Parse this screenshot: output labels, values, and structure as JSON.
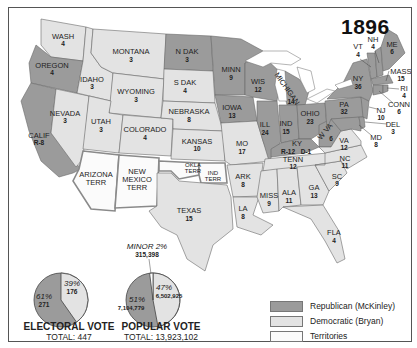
{
  "title": "1896",
  "colors": {
    "republican": "#9b9b9b",
    "democratic": "#e3e3e3",
    "territories": "#fbfbfb"
  },
  "legend": [
    {
      "party": "republican",
      "label": "Republican (McKinley)"
    },
    {
      "party": "democratic",
      "label": "Democratic (Bryan)"
    },
    {
      "party": "territories",
      "label": "Territories"
    }
  ],
  "states": {
    "wash": {
      "name": "WASH",
      "votes": "4",
      "party": "democratic"
    },
    "oregon": {
      "name": "OREGON",
      "votes": "4",
      "party": "republican"
    },
    "calif": {
      "name": "CALIF",
      "votes": "R-8",
      "party": "republican"
    },
    "idaho": {
      "name": "IDAHO",
      "votes": "3",
      "party": "democratic"
    },
    "nevada": {
      "name": "NEVADA",
      "votes": "3",
      "party": "democratic"
    },
    "montana": {
      "name": "MONTANA",
      "votes": "3",
      "party": "democratic"
    },
    "wyoming": {
      "name": "WYOMING",
      "votes": "3",
      "party": "democratic"
    },
    "utah": {
      "name": "UTAH",
      "votes": "3",
      "party": "democratic"
    },
    "colorado": {
      "name": "COLORADO",
      "votes": "4",
      "party": "democratic"
    },
    "ndak": {
      "name": "N DAK",
      "votes": "3",
      "party": "republican"
    },
    "sdak": {
      "name": "S DAK",
      "votes": "4",
      "party": "democratic"
    },
    "nebraska": {
      "name": "NEBRASKA",
      "votes": "8",
      "party": "democratic"
    },
    "kansas": {
      "name": "KANSAS",
      "votes": "10",
      "party": "democratic"
    },
    "texas": {
      "name": "TEXAS",
      "votes": "15",
      "party": "democratic"
    },
    "minn": {
      "name": "MINN",
      "votes": "9",
      "party": "republican"
    },
    "iowa": {
      "name": "IOWA",
      "votes": "13",
      "party": "republican"
    },
    "mo": {
      "name": "MO",
      "votes": "17",
      "party": "democratic"
    },
    "ark": {
      "name": "ARK",
      "votes": "8",
      "party": "democratic"
    },
    "la": {
      "name": "LA",
      "votes": "8",
      "party": "democratic"
    },
    "wis": {
      "name": "WIS",
      "votes": "12",
      "party": "republican"
    },
    "ill": {
      "name": "ILL",
      "votes": "24",
      "party": "republican"
    },
    "michigan": {
      "name": "MICHIGAN",
      "votes": "14",
      "party": "republican"
    },
    "ind": {
      "name": "IND",
      "votes": "15",
      "party": "republican"
    },
    "ohio": {
      "name": "OHIO",
      "votes": "23",
      "party": "republican"
    },
    "ky": {
      "name": "KY",
      "votes_r": "R-12",
      "votes_d": "D-1",
      "party": "republican"
    },
    "tenn": {
      "name": "TENN",
      "votes": "12",
      "party": "democratic"
    },
    "miss": {
      "name": "MISS",
      "votes": "9",
      "party": "democratic"
    },
    "ala": {
      "name": "ALA",
      "votes": "11",
      "party": "democratic"
    },
    "ga": {
      "name": "GA",
      "votes": "13",
      "party": "democratic"
    },
    "fla": {
      "name": "FLA",
      "votes": "4",
      "party": "democratic"
    },
    "sc": {
      "name": "SC",
      "votes": "9",
      "party": "democratic"
    },
    "nc": {
      "name": "NC",
      "votes": "11",
      "party": "democratic"
    },
    "va": {
      "name": "VA",
      "votes": "12",
      "party": "democratic"
    },
    "wva": {
      "name": "W VA",
      "votes": "6",
      "party": "republican"
    },
    "pa": {
      "name": "PA",
      "votes": "32",
      "party": "republican"
    },
    "ny": {
      "name": "NY",
      "votes": "36",
      "party": "republican"
    },
    "vt": {
      "name": "VT",
      "votes": "4",
      "party": "republican"
    },
    "nh": {
      "name": "NH",
      "votes": "4",
      "party": "republican"
    },
    "me": {
      "name": "ME",
      "votes": "6",
      "party": "republican"
    },
    "mass": {
      "name": "MASS",
      "votes": "15",
      "party": "republican"
    },
    "ri": {
      "name": "RI",
      "votes": "4",
      "party": "republican"
    },
    "conn": {
      "name": "CONN",
      "votes": "6",
      "party": "republican"
    },
    "nj": {
      "name": "NJ",
      "votes": "10",
      "party": "republican"
    },
    "del": {
      "name": "DEL",
      "votes": "3",
      "party": "republican"
    },
    "md": {
      "name": "MD",
      "votes": "8",
      "party": "republican"
    }
  },
  "territories": {
    "arizona": {
      "line1": "ARIZONA",
      "line2": "TERR"
    },
    "new_mexico": {
      "line1": "NEW",
      "line2": "MEXICO",
      "line3": "TERR"
    },
    "okla": {
      "line1": "OKLA",
      "line2": "TERR"
    },
    "ind_terr": {
      "line1": "IND",
      "line2": "TERR"
    }
  },
  "electoral_vote": {
    "title": "ELECTORAL VOTE",
    "total": "TOTAL: 447",
    "republican_pct": "61%",
    "republican_votes": "271",
    "democratic_pct": "39%",
    "democratic_votes": "176"
  },
  "popular_vote": {
    "title": "POPULAR VOTE",
    "total": "TOTAL: 13,923,102",
    "republican_pct": "51%",
    "republican_votes": "7,104,779",
    "democratic_pct": "47%",
    "democratic_votes": "6,502,925",
    "minor_pct": "MINOR 2%",
    "minor_votes": "315,398"
  }
}
